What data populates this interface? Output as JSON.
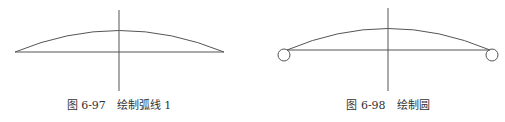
{
  "figures": [
    {
      "id": "fig-6-97",
      "caption": "图 6-97　绘制弧线 1",
      "caption_x": 119,
      "elements": [
        "horizontal-line",
        "vertical-line",
        "arc"
      ]
    },
    {
      "id": "fig-6-98",
      "caption": "图 6-98　绘制圆",
      "caption_x": 388,
      "elements": [
        "horizontal-line",
        "vertical-line",
        "arc",
        "circle-left",
        "circle-right"
      ]
    }
  ],
  "colors": {
    "line": "#555555",
    "text": "#333333",
    "background": "#ffffff"
  }
}
